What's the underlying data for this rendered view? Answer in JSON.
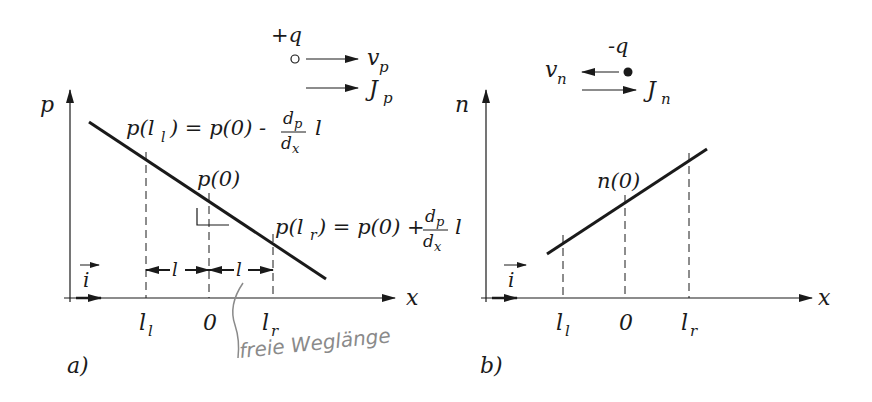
{
  "panel_a": {
    "caption": "a)",
    "y_axis_label": "p",
    "x_axis_label": "x",
    "carrier": {
      "charge": "+q",
      "velocity": "v",
      "velocity_sub": "p",
      "current": "J",
      "current_sub": "p",
      "symbol": "open-circle"
    },
    "eq_left": {
      "lhs": "p(l",
      "lhs_sub": "l",
      "rhs": ") = p(0) -",
      "frac_num": "d",
      "frac_num_sub": "p",
      "frac_den": "d",
      "frac_den_sub": "x",
      "tail": "l"
    },
    "eq_right": {
      "lhs": "p(l",
      "lhs_sub": "r",
      "rhs": ") = p(0) +",
      "frac_num": "d",
      "frac_num_sub": "p",
      "frac_den": "d",
      "frac_den_sub": "x",
      "tail": "l"
    },
    "center_label": "p(0)",
    "ticks": [
      {
        "main": "l",
        "sub": "l"
      },
      {
        "main": "0",
        "sub": ""
      },
      {
        "main": "l",
        "sub": "r"
      }
    ],
    "span_label": "l",
    "unit_vector": "i",
    "handwritten_note": "freie Weglänge"
  },
  "panel_b": {
    "caption": "b)",
    "y_axis_label": "n",
    "x_axis_label": "x",
    "carrier": {
      "charge": "-q",
      "velocity": "v",
      "velocity_sub": "n",
      "current": "J",
      "current_sub": "n",
      "symbol": "filled-dot"
    },
    "center_label": "n(0)",
    "ticks": [
      {
        "main": "l",
        "sub": "l"
      },
      {
        "main": "0",
        "sub": ""
      },
      {
        "main": "l",
        "sub": "r"
      }
    ],
    "unit_vector": "i"
  },
  "colors": {
    "ink": "#1a1a1a",
    "pencil": "#8a8a8a",
    "background": "#ffffff"
  }
}
